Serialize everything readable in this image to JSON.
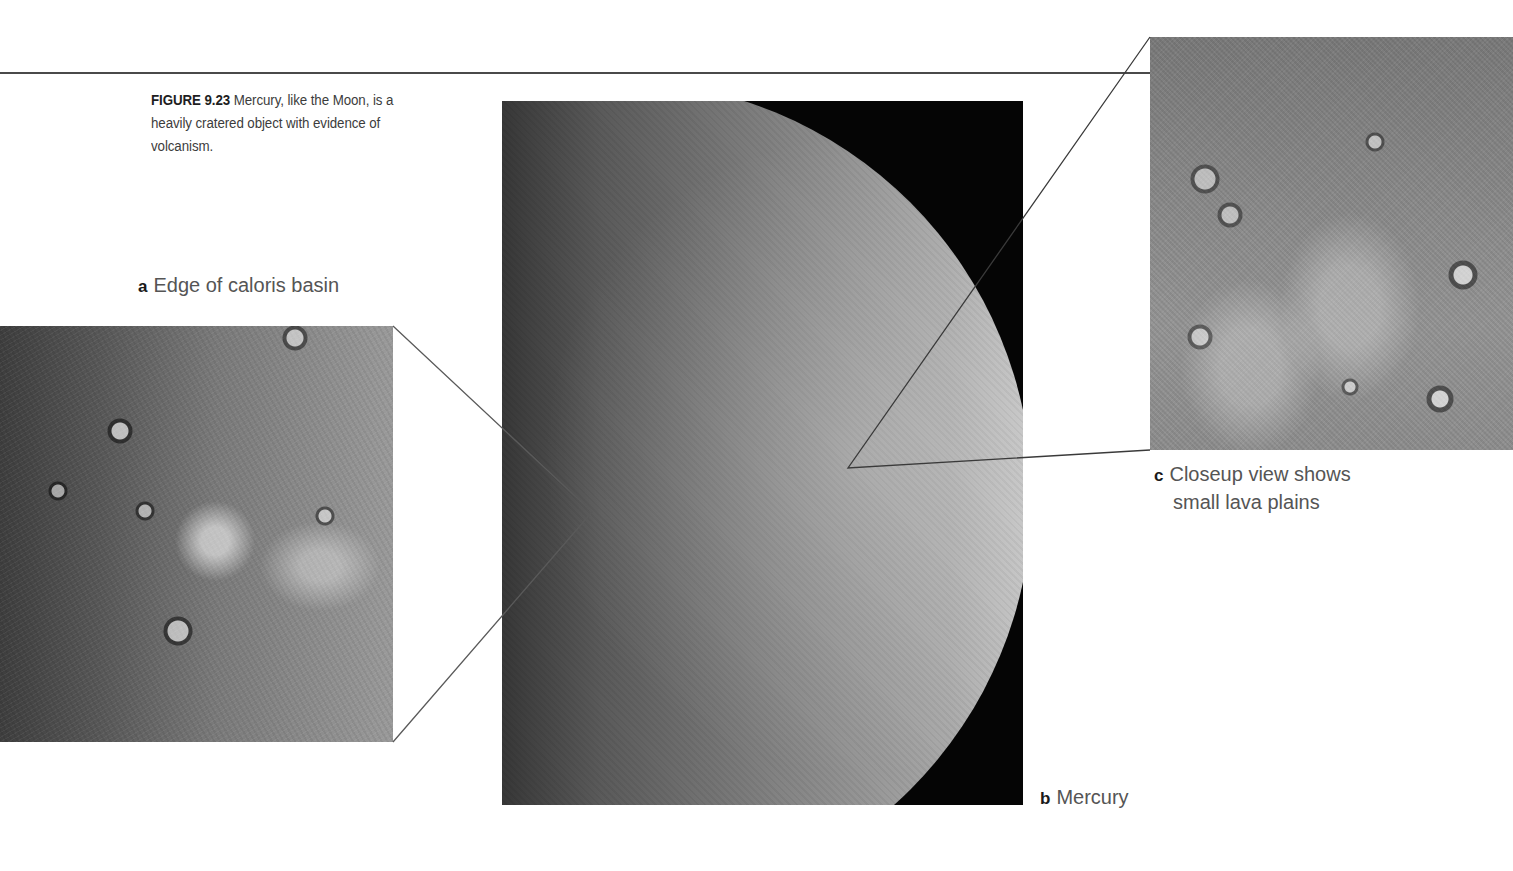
{
  "figure": {
    "number": "FIGURE 9.23",
    "caption": "Mercury, like the Moon, is a heavily cratered object with evidence of volcanism."
  },
  "panels": {
    "a": {
      "letter": "a",
      "label": "Edge of caloris basin",
      "image_desc": "closeup-caloris-basin-edge"
    },
    "b": {
      "letter": "b",
      "label": "Mercury",
      "image_desc": "mercury-full-disk"
    },
    "c": {
      "letter": "c",
      "label_line1": "Closeup view shows",
      "label_line2": "small lava plains",
      "image_desc": "closeup-lava-plains"
    }
  },
  "colors": {
    "rule": "#4a4a4a",
    "leader_lines": "#4a4a4a",
    "caption_bold": "#1e1e1e",
    "caption_text": "#3c3c3c",
    "label_text": "#555555",
    "space_background": "#050505"
  }
}
